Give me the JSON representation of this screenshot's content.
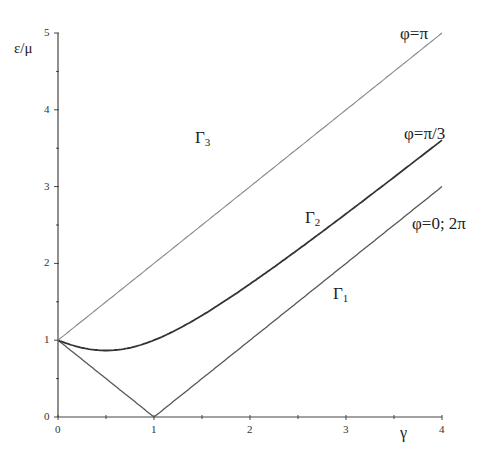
{
  "chart_data": {
    "type": "line",
    "title": "",
    "xlabel": "γ",
    "ylabel": "ε/μ",
    "xlim": [
      0,
      4
    ],
    "ylim": [
      0,
      5
    ],
    "x_ticks": [
      "0",
      "1",
      "2",
      "3",
      "4"
    ],
    "y_ticks": [
      "0",
      "1",
      "2",
      "3",
      "4",
      "5"
    ],
    "grid": false,
    "legend": "none (inline curve labels)",
    "series": [
      {
        "name": "Γ1",
        "annotation": "φ=0; 2π",
        "formula": "|1-γ|",
        "x": [
          0,
          0.5,
          1,
          2,
          3,
          4
        ],
        "values": [
          1,
          0.5,
          0,
          1,
          2,
          3
        ]
      },
      {
        "name": "Γ2",
        "annotation": "φ=π/3",
        "formula": "sqrt(1+γ²-γ)",
        "x": [
          0,
          0.5,
          1,
          2,
          3,
          4
        ],
        "values": [
          1,
          0.87,
          1,
          1.73,
          2.65,
          3.61
        ]
      },
      {
        "name": "Γ3",
        "annotation": "φ=π",
        "formula": "1+γ",
        "x": [
          0,
          1,
          2,
          3,
          4
        ],
        "values": [
          1,
          2,
          3,
          4,
          5
        ]
      }
    ]
  },
  "axes": {
    "ylabel": "ε/μ",
    "xlabel": "γ",
    "x_ticks": [
      "0",
      "1",
      "2",
      "3",
      "4"
    ],
    "y_ticks": [
      "0",
      "1",
      "2",
      "3",
      "4",
      "5"
    ]
  },
  "labels": {
    "g1": "Γ",
    "g1_sub": "1",
    "g2": "Γ",
    "g2_sub": "2",
    "g3": "Γ",
    "g3_sub": "3",
    "phi_pi": "φ=π",
    "phi_pi3": "φ=π/3",
    "phi_0": "φ=0; 2π"
  }
}
